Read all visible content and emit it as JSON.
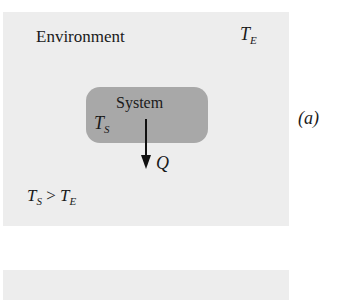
{
  "diagram": {
    "environment_label": "Environment",
    "environment_temp": {
      "symbol": "T",
      "subscript": "E"
    },
    "system_label": "System",
    "system_temp": {
      "symbol": "T",
      "subscript": "S"
    },
    "heat_label": "Q",
    "condition": {
      "left": "T",
      "left_sub": "S",
      "op": " > ",
      "right": "T",
      "right_sub": "E"
    },
    "part_label": "(a)",
    "colors": {
      "environment": "#ededed",
      "system": "#a8a8a8",
      "arrow": "#111111"
    }
  }
}
